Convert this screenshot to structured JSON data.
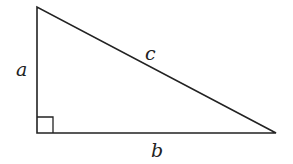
{
  "diagram": {
    "vertices": {
      "top": [
        37,
        7
      ],
      "right_angle": [
        37,
        133
      ],
      "right": [
        276,
        133
      ]
    },
    "labels": {
      "a": "a",
      "b": "b",
      "c": "c"
    },
    "right_angle_marker": true,
    "stroke_color": "#222222"
  }
}
